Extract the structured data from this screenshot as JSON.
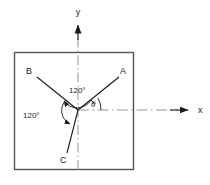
{
  "figure": {
    "type": "vector-diagram",
    "title": "",
    "background_color": "#ffffff",
    "ink_color": "#1b1b1b",
    "frame": {
      "name": "plate-boundary",
      "x": 14,
      "y": 52,
      "width": 120,
      "height": 118,
      "stroke": "#555555"
    },
    "origin": {
      "x": 78,
      "y": 110
    },
    "axes": [
      {
        "id": "x",
        "label": "x",
        "label_x": 201,
        "label_y": 112,
        "style": "dash-dot",
        "direction": "right",
        "arrow_tip_x": 188,
        "arrow_tip_y": 110
      },
      {
        "id": "y",
        "label": "y",
        "label_x": 78,
        "label_y": 12,
        "style": "dash-dot",
        "direction": "up",
        "arrow_tip_x": 78,
        "arrow_tip_y": 22
      }
    ],
    "vectors": [
      {
        "id": "A",
        "label": "A",
        "angle_deg": 30,
        "label_x": 123,
        "label_y": 73,
        "end_x": 118,
        "end_y": 78
      },
      {
        "id": "B",
        "label": "B",
        "angle_deg": 150,
        "label_x": 29,
        "label_y": 73,
        "end_x": 37,
        "end_y": 78
      },
      {
        "id": "C",
        "label": "C",
        "angle_deg": 270,
        "label_x": 63,
        "label_y": 161,
        "end_x": 68,
        "end_y": 152
      }
    ],
    "angle_arcs": [
      {
        "id": "arc-AB",
        "label": "120°",
        "between": [
          "A",
          "B"
        ],
        "label_x": 71,
        "label_y": 92
      },
      {
        "id": "arc-BC",
        "label": "120°",
        "between": [
          "B",
          "C"
        ],
        "label_x": 26,
        "label_y": 116
      },
      {
        "id": "arc-theta",
        "label": "θ",
        "between": [
          "x-axis",
          "A"
        ],
        "label_x": 93,
        "label_y": 107
      }
    ]
  }
}
